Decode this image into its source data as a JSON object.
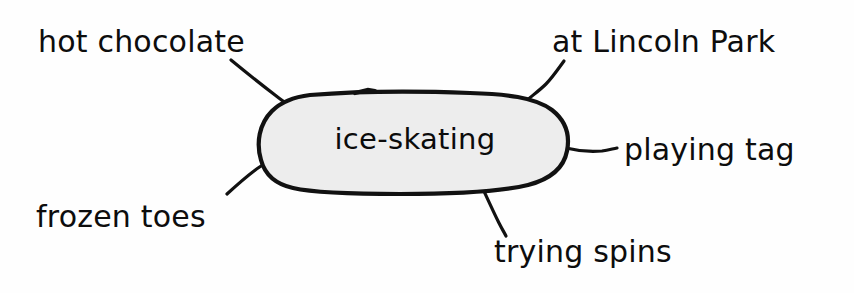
{
  "diagram": {
    "type": "brainstorming-web",
    "center": {
      "label": "ice-skating",
      "shape": "rounded-oval",
      "fill_color": "#ededed",
      "stroke_color": "#111111"
    },
    "branches": [
      {
        "id": "hot-chocolate",
        "label": "hot chocolate",
        "position": "top-left"
      },
      {
        "id": "at-lincoln-park",
        "label": "at Lincoln Park",
        "position": "top-right"
      },
      {
        "id": "playing-tag",
        "label": "playing tag",
        "position": "right"
      },
      {
        "id": "frozen-toes",
        "label": "frozen toes",
        "position": "bottom-left"
      },
      {
        "id": "trying-spins",
        "label": "trying spins",
        "position": "bottom-right"
      }
    ],
    "colors": {
      "background": "#fefefe",
      "ink": "#0d0d0d",
      "bubble_fill": "#ededed"
    }
  }
}
